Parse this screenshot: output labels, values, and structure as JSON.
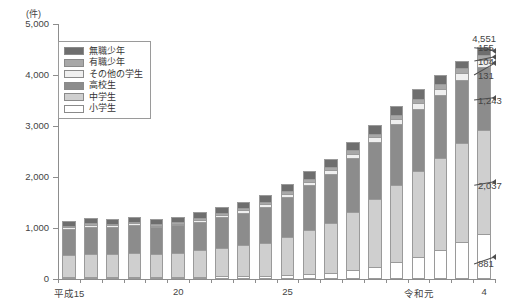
{
  "chart_data": {
    "type": "bar",
    "stacked": true,
    "title": "",
    "xlabel": "",
    "ylabel": "",
    "unit_label": "(件)",
    "ylim": [
      0,
      5000
    ],
    "yticks": [
      0,
      1000,
      2000,
      3000,
      4000,
      5000
    ],
    "ytick_labels": [
      "0",
      "1,000",
      "2,000",
      "3,000",
      "4,000",
      "5,000"
    ],
    "grid": false,
    "legend_position": "upper-left-inside",
    "categories": [
      "平成15",
      "16",
      "17",
      "18",
      "19",
      "20",
      "21",
      "22",
      "23",
      "24",
      "25",
      "26",
      "27",
      "28",
      "29",
      "30",
      "令和元",
      "2",
      "3",
      "4"
    ],
    "xtick_labels": [
      {
        "index": 0,
        "label": "平成15"
      },
      {
        "index": 5,
        "label": "20"
      },
      {
        "index": 10,
        "label": "25"
      },
      {
        "index": 16,
        "label": "令和元"
      },
      {
        "index": 19,
        "label": "4"
      }
    ],
    "series": [
      {
        "name": "小学生",
        "color": "#ffffff",
        "values": [
          28,
          30,
          32,
          35,
          38,
          42,
          46,
          50,
          58,
          66,
          78,
          95,
          120,
          170,
          240,
          330,
          430,
          560,
          720,
          881
        ]
      },
      {
        "name": "中学生",
        "color": "#cfcfcf",
        "values": [
          430,
          450,
          455,
          470,
          455,
          470,
          520,
          560,
          600,
          650,
          740,
          860,
          980,
          1150,
          1320,
          1510,
          1680,
          1810,
          1940,
          2037
        ]
      },
      {
        "name": "高校生",
        "color": "#8c8c8c",
        "values": [
          520,
          540,
          530,
          545,
          520,
          540,
          560,
          600,
          640,
          700,
          790,
          880,
          960,
          1050,
          1120,
          1190,
          1230,
          1240,
          1250,
          1243
        ]
      },
      {
        "name": "その他の学生",
        "color": "#efefef",
        "values": [
          30,
          32,
          34,
          36,
          34,
          36,
          40,
          44,
          48,
          54,
          62,
          70,
          78,
          88,
          96,
          104,
          112,
          118,
          124,
          131
        ]
      },
      {
        "name": "有職少年",
        "color": "#a8a8a8",
        "values": [
          26,
          28,
          28,
          30,
          28,
          30,
          32,
          35,
          38,
          42,
          48,
          54,
          60,
          66,
          72,
          80,
          88,
          94,
          100,
          104
        ]
      },
      {
        "name": "無職少年",
        "color": "#6e6e6e",
        "values": [
          96,
          100,
          98,
          102,
          96,
          100,
          108,
          115,
          122,
          130,
          140,
          150,
          158,
          166,
          172,
          178,
          182,
          186,
          150,
          155
        ]
      }
    ],
    "totals": [
      1130,
      1180,
      1177,
      1218,
      1171,
      1218,
      1306,
      1404,
      1506,
      1642,
      1858,
      2109,
      2356,
      2690,
      3020,
      3392,
      3722,
      4008,
      4284,
      4551
    ],
    "annotations": {
      "total_top": {
        "label": "4,551",
        "bar_index": 19
      },
      "callouts": [
        {
          "label": "155",
          "series": "無職少年",
          "value": 155
        },
        {
          "label": "104",
          "series": "有職少年",
          "value": 104
        },
        {
          "label": "131",
          "series": "その他の学生",
          "value": 131
        },
        {
          "label": "1,243",
          "series": "高校生",
          "value": 1243
        },
        {
          "label": "2,037",
          "series": "中学生",
          "value": 2037
        },
        {
          "label": "881",
          "series": "小学生",
          "value": 881
        }
      ]
    }
  },
  "legend": {
    "items": [
      {
        "label": "無職少年"
      },
      {
        "label": "有職少年"
      },
      {
        "label": "その他の学生"
      },
      {
        "label": "高校生"
      },
      {
        "label": "中学生"
      },
      {
        "label": "小学生"
      }
    ]
  }
}
